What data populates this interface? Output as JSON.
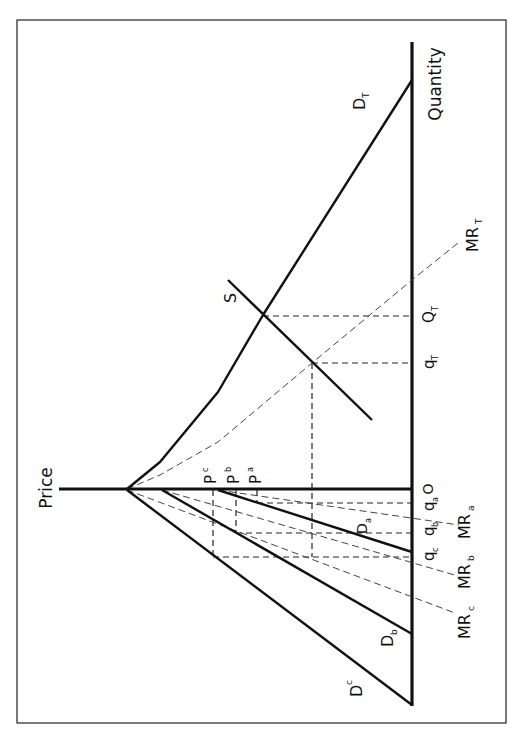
{
  "figure": {
    "orientation": "rotated 90 degrees counter-clockwise",
    "axes": {
      "price_label": "Price",
      "quantity_label": "Quantity",
      "origin_label": "O"
    },
    "curves": {
      "D_T": {
        "label": "D",
        "sub": "T"
      },
      "MR_T": {
        "label": "MR",
        "sub": "T"
      },
      "S": {
        "label": "S"
      },
      "D_a": {
        "label": "D",
        "sub": "a"
      },
      "D_b": {
        "label": "D",
        "sub": "b"
      },
      "D_c": {
        "label": "D",
        "sub": "c"
      },
      "MR_a": {
        "label": "MR",
        "sub": "a"
      },
      "MR_b": {
        "label": "MR",
        "sub": "b"
      },
      "MR_c": {
        "label": "MR",
        "sub": "c"
      }
    },
    "quantity_ticks": [
      {
        "label": "q",
        "sub": "a"
      },
      {
        "label": "q",
        "sub": "b"
      },
      {
        "label": "q",
        "sub": "c"
      },
      {
        "label": "q",
        "sub": "T"
      },
      {
        "label": "Q",
        "sub": "T"
      }
    ],
    "price_ticks": [
      {
        "label": "P",
        "sup": "c"
      },
      {
        "label": "P",
        "sup": "b"
      },
      {
        "label": "P",
        "sup": "a"
      }
    ]
  }
}
